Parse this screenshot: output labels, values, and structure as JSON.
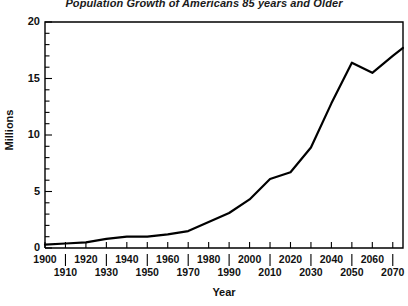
{
  "chart_data": {
    "type": "line",
    "title": "Population Growth of Americans 85 years and Older",
    "xlabel": "Year",
    "ylabel": "Millions",
    "xlim": [
      1900,
      2075
    ],
    "ylim": [
      0,
      20
    ],
    "grid": false,
    "legend": null,
    "y_ticks": [
      0,
      5,
      10,
      15,
      20
    ],
    "y_minor_tick_step": 1,
    "x_ticks_top_row": [
      1900,
      1920,
      1940,
      1960,
      1980,
      2000,
      2020,
      2040,
      2060
    ],
    "x_ticks_bottom_row": [
      1910,
      1930,
      1950,
      1970,
      1990,
      2010,
      2030,
      2050,
      2070
    ],
    "x": [
      1900,
      1910,
      1920,
      1930,
      1940,
      1950,
      1960,
      1970,
      1980,
      1990,
      2000,
      2010,
      2020,
      2030,
      2040,
      2050,
      2060,
      2070,
      2075
    ],
    "values": [
      0.3,
      0.4,
      0.5,
      0.8,
      1.0,
      1.0,
      1.2,
      1.5,
      2.3,
      3.1,
      4.3,
      6.1,
      6.7,
      8.9,
      12.8,
      16.4,
      15.5,
      17.0,
      17.7
    ],
    "series": [
      {
        "name": "Population 85 years and older",
        "values": [
          0.3,
          0.4,
          0.5,
          0.8,
          1.0,
          1.0,
          1.2,
          1.5,
          2.3,
          3.1,
          4.3,
          6.1,
          6.7,
          8.9,
          12.8,
          16.4,
          15.5,
          17.0,
          17.7
        ]
      }
    ],
    "line_color": "#000000"
  }
}
